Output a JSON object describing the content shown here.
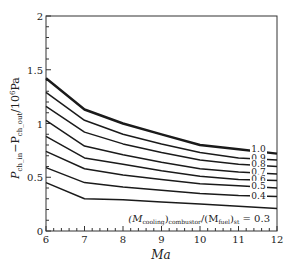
{
  "chart_data": {
    "type": "line",
    "title": "",
    "xlabel": "Ma",
    "ylabel": "P_ch_in − P_ch_out / 10^6 Pa",
    "xlim": [
      6,
      12
    ],
    "ylim": [
      0,
      2
    ],
    "x_ticks": [
      "6",
      "7",
      "8",
      "9",
      "10",
      "11",
      "12"
    ],
    "y_ticks": [
      "0",
      "0.5",
      "1",
      "1.5",
      "2"
    ],
    "grid": false,
    "legend_position": "inline labels at right end of each curve",
    "annotation": "(M_cooling)_combustor/(M_fuel)_st = 0.3",
    "x": [
      6,
      7,
      8,
      9,
      10,
      11,
      12
    ],
    "series": [
      {
        "name": "1.0",
        "values": [
          1.42,
          1.13,
          1.0,
          0.9,
          0.8,
          0.76,
          0.72
        ],
        "bold": true
      },
      {
        "name": "0.9",
        "values": [
          1.29,
          1.03,
          0.9,
          0.81,
          0.73,
          0.68,
          0.66
        ]
      },
      {
        "name": "0.8",
        "values": [
          1.16,
          0.92,
          0.81,
          0.73,
          0.66,
          0.62,
          0.6
        ]
      },
      {
        "name": "0.7",
        "values": [
          1.03,
          0.79,
          0.71,
          0.64,
          0.58,
          0.55,
          0.53
        ]
      },
      {
        "name": "0.6",
        "values": [
          0.88,
          0.68,
          0.62,
          0.56,
          0.51,
          0.48,
          0.47
        ]
      },
      {
        "name": "0.5",
        "values": [
          0.74,
          0.58,
          0.52,
          0.48,
          0.44,
          0.42,
          0.4
        ]
      },
      {
        "name": "0.4",
        "values": [
          0.59,
          0.45,
          0.41,
          0.38,
          0.35,
          0.33,
          0.32
        ]
      },
      {
        "name": "0.3",
        "values": [
          0.45,
          0.3,
          0.29,
          0.27,
          0.25,
          0.23,
          0.21
        ]
      }
    ]
  },
  "labels": {
    "xlabel": "Ma",
    "ylabel_main": "P",
    "ylabel_sub1": "ch_in",
    "ylabel_mid": "−P",
    "ylabel_sub2": "ch_out",
    "ylabel_unit": "/10",
    "ylabel_exp": "6",
    "ylabel_pa": "Pa",
    "annotation_prefix": "(M",
    "annotation_sub1": "cooling",
    "annotation_mid1": ")",
    "annotation_sub2": "combustor",
    "annotation_mid2": "/(M",
    "annotation_sub3": "fuel",
    "annotation_mid3": ")",
    "annotation_sub4": "st",
    "annotation_suffix": " = 0.3"
  },
  "colors": {
    "line": "#1a1a1a",
    "axis": "#333333",
    "background": "#ffffff"
  }
}
